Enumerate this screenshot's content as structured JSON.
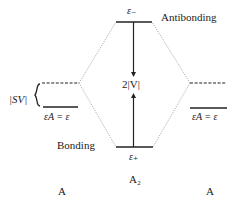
{
  "diagram": {
    "type": "molecular-orbital-energy-level-diagram",
    "labels": {
      "antibonding": "Antibonding",
      "bonding": "Bonding",
      "e_minus": "ε₋",
      "e_plus": "ε₊",
      "splitting": "2|V|",
      "shift": "|SV|",
      "left_level": "εA = ε",
      "right_level": "εA = ε",
      "left_atom": "A",
      "center_molecule": "A₂",
      "right_atom": "A"
    },
    "levels": [
      {
        "name": "antibonding",
        "x1": 116,
        "x2": 152,
        "y": 22,
        "style": "solid"
      },
      {
        "name": "bonding",
        "x1": 116,
        "x2": 153,
        "y": 147,
        "style": "solid"
      },
      {
        "name": "left-shifted",
        "x1": 42,
        "x2": 79,
        "y": 83,
        "style": "dashed"
      },
      {
        "name": "left-atomic",
        "x1": 43,
        "x2": 78,
        "y": 107,
        "style": "solid"
      },
      {
        "name": "right-shifted",
        "x1": 190,
        "x2": 226,
        "y": 83,
        "style": "dashed"
      },
      {
        "name": "right-atomic",
        "x1": 190,
        "x2": 227,
        "y": 108,
        "style": "solid"
      }
    ],
    "colors": {
      "line": "#222222",
      "connector": "#9a9a9a"
    }
  }
}
